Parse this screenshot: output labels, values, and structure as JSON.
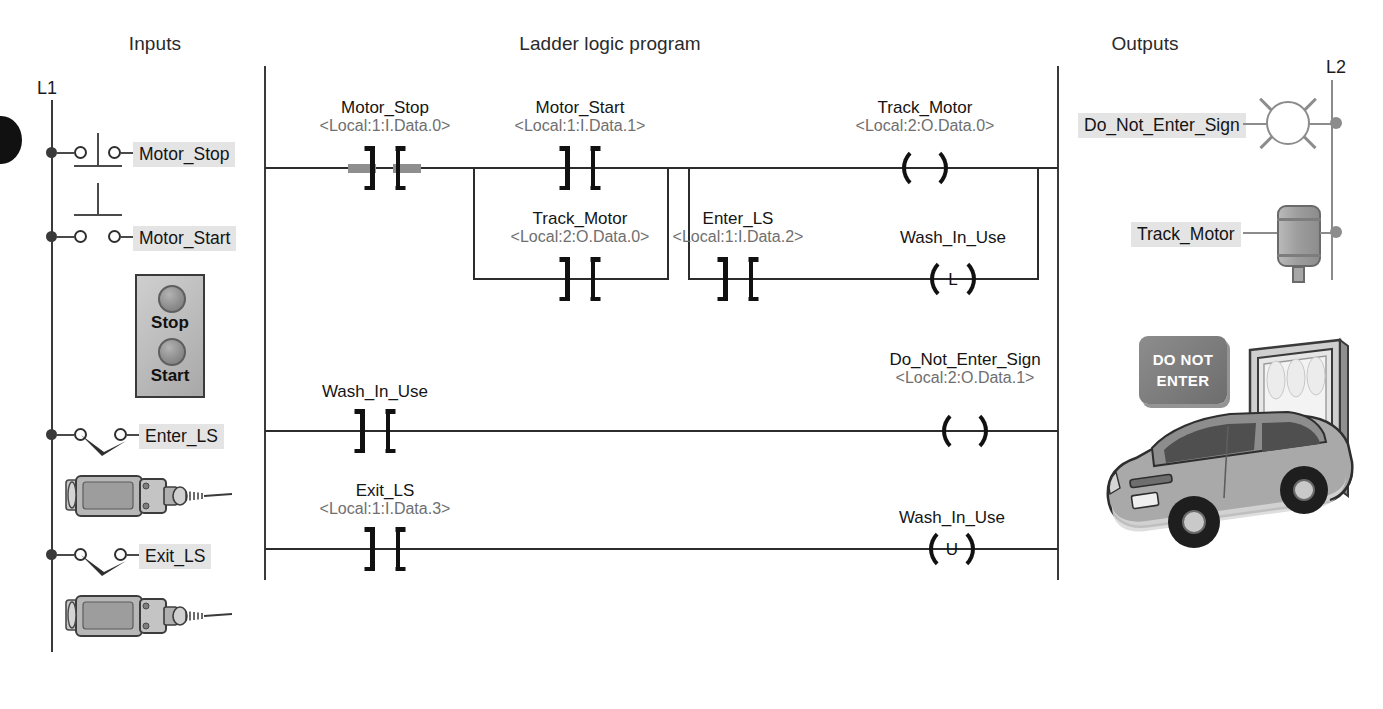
{
  "headings": {
    "inputs": "Inputs",
    "ladder": "Ladder logic program",
    "outputs": "Outputs"
  },
  "rails": {
    "left_label": "L1",
    "right_label": "L2"
  },
  "inputs": {
    "devices": [
      {
        "tag": "Motor_Stop",
        "symbol": "nc-pushbutton"
      },
      {
        "tag": "Motor_Start",
        "symbol": "no-pushbutton"
      },
      {
        "tag": "Enter_LS",
        "symbol": "limit-switch-no"
      },
      {
        "tag": "Exit_LS",
        "symbol": "limit-switch-no"
      }
    ],
    "pushbutton_station": {
      "stop_label": "Stop",
      "start_label": "Start"
    }
  },
  "outputs": {
    "devices": [
      {
        "tag": "Do_Not_Enter_Sign",
        "symbol": "pilot-lamp"
      },
      {
        "tag": "Track_Motor",
        "symbol": "motor"
      }
    ],
    "scene_sign": {
      "line1": "DO NOT",
      "line2": "ENTER"
    }
  },
  "ladder": {
    "rungs": [
      {
        "number": 0,
        "instructions": [
          {
            "name": "Motor_Stop",
            "address": "<Local:1:I.Data.0>",
            "type": "XIC",
            "energized": true
          },
          {
            "name": "Motor_Start",
            "address": "<Local:1:I.Data.1>",
            "type": "XIC",
            "energized": false
          },
          {
            "name": "Track_Motor",
            "address": "<Local:2:O.Data.0>",
            "type": "XIC",
            "energized": false,
            "branch": "1-lower"
          },
          {
            "name": "Track_Motor",
            "address": "<Local:2:O.Data.0>",
            "type": "OTE",
            "glyph": ""
          },
          {
            "name": "Enter_LS",
            "address": "<Local:1:I.Data.2>",
            "type": "XIC",
            "energized": false,
            "branch": "2-lower"
          },
          {
            "name": "Wash_In_Use",
            "address": "",
            "type": "OTL",
            "glyph": "L",
            "branch": "2-lower"
          }
        ]
      },
      {
        "number": 1,
        "instructions": [
          {
            "name": "Wash_In_Use",
            "address": "",
            "type": "XIC",
            "energized": false
          },
          {
            "name": "Do_Not_Enter_Sign",
            "address": "<Local:2:O.Data.1>",
            "type": "OTE",
            "glyph": ""
          }
        ]
      },
      {
        "number": 2,
        "instructions": [
          {
            "name": "Exit_LS",
            "address": "<Local:1:I.Data.3>",
            "type": "XIC",
            "energized": false
          },
          {
            "name": "Wash_In_Use",
            "address": "",
            "type": "OTU",
            "glyph": "U"
          }
        ]
      }
    ]
  },
  "colors": {
    "rail": "#3a3a3a",
    "wire": "#2c2c2c",
    "instruction": "#111111",
    "address_text": "#6f6f6f",
    "chip_bg": "#e4e4e4",
    "device_gray": "#8c8c8c"
  }
}
